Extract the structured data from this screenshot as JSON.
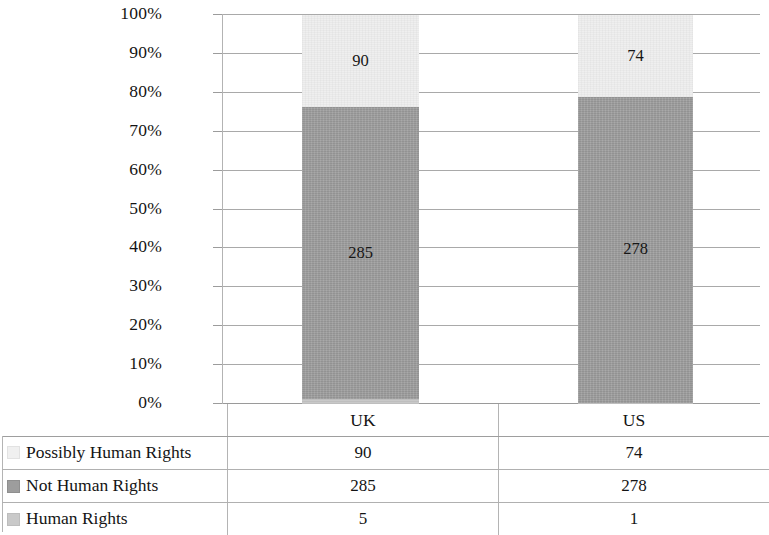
{
  "chart_data": {
    "type": "bar",
    "subtype": "stacked-100-percent",
    "title": "",
    "xlabel": "",
    "ylabel": "",
    "categories": [
      "UK",
      "US"
    ],
    "series": [
      {
        "name": "Human Rights",
        "values": [
          5,
          1
        ],
        "color": "#c9c9c9"
      },
      {
        "name": "Not Human Rights",
        "values": [
          285,
          278
        ],
        "color": "#9d9d9d"
      },
      {
        "name": "Possibly Human Rights",
        "values": [
          90,
          74
        ],
        "color": "#f0f0f0"
      }
    ],
    "totals": [
      380,
      353
    ],
    "ylim": [
      0,
      100
    ],
    "ytick_labels": [
      "100%",
      "90%",
      "80%",
      "70%",
      "60%",
      "50%",
      "40%",
      "30%",
      "20%",
      "10%",
      "0%"
    ],
    "ytick_values": [
      100,
      90,
      80,
      70,
      60,
      50,
      40,
      30,
      20,
      10,
      0
    ],
    "grid": true,
    "legend_position": "bottom-table",
    "data_labels_visible": {
      "UK": {
        "possibly": "90",
        "not_hr": "285",
        "hr": ""
      },
      "US": {
        "possibly": "74",
        "not_hr": "278",
        "hr": ""
      }
    }
  },
  "axis": {
    "y_ticks": [
      {
        "label": "100%",
        "value": 100
      },
      {
        "label": "90%",
        "value": 90
      },
      {
        "label": "80%",
        "value": 80
      },
      {
        "label": "70%",
        "value": 70
      },
      {
        "label": "60%",
        "value": 60
      },
      {
        "label": "50%",
        "value": 50
      },
      {
        "label": "40%",
        "value": 40
      },
      {
        "label": "30%",
        "value": 30
      },
      {
        "label": "20%",
        "value": 20
      },
      {
        "label": "10%",
        "value": 10
      },
      {
        "label": "0%",
        "value": 0
      }
    ]
  },
  "bars": {
    "uk": {
      "category": "UK",
      "possibly": {
        "label": "90",
        "percent": 23.68
      },
      "not_hr": {
        "label": "285",
        "percent": 75.0
      },
      "hr": {
        "label": "",
        "percent": 1.32
      }
    },
    "us": {
      "category": "US",
      "possibly": {
        "label": "74",
        "percent": 20.96
      },
      "not_hr": {
        "label": "278",
        "percent": 78.76
      },
      "hr": {
        "label": "",
        "percent": 0.28
      }
    }
  },
  "table": {
    "category_row": {
      "legend_header": "",
      "uk": "UK",
      "us": "US"
    },
    "rows": [
      {
        "swatch": "possibly",
        "label": "Possibly Human Rights",
        "uk": "90",
        "us": "74"
      },
      {
        "swatch": "not-hr",
        "label": "Not Human Rights",
        "uk": "285",
        "us": "278"
      },
      {
        "swatch": "hr",
        "label": "Human Rights",
        "uk": "5",
        "us": "1"
      }
    ]
  },
  "colors": {
    "possibly_human_rights": "#f0f0f0",
    "not_human_rights": "#9d9d9d",
    "human_rights": "#c9c9c9",
    "gridline": "#a9a9a9",
    "text": "#141414"
  }
}
